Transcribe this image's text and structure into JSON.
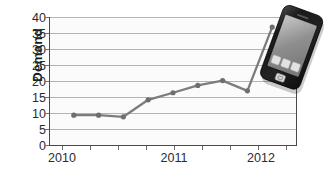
{
  "chart_data": {
    "type": "line",
    "title": "",
    "subtitle": "",
    "xlabel": "",
    "ylabel": "Demand",
    "ylim": [
      0,
      40
    ],
    "ytick_labels": [
      "40",
      "35",
      "30",
      "25",
      "20",
      "15",
      "10",
      "5",
      "0"
    ],
    "ytick_values": [
      40,
      35,
      30,
      25,
      20,
      15,
      10,
      5,
      0
    ],
    "xtick_labels": [
      "2010",
      "2011",
      "2012"
    ],
    "xtick_values": [
      2010,
      2011,
      2012
    ],
    "grid": "horizontal",
    "legend": "none",
    "marker": "circle",
    "x": [
      2010.0,
      2010.25,
      2010.5,
      2010.75,
      2011.0,
      2011.25,
      2011.5,
      2011.75,
      2012.0
    ],
    "values": [
      9.5,
      9.5,
      9.0,
      14.3,
      16.5,
      18.8,
      20.3,
      17.1,
      37.0
    ],
    "series": [
      {
        "name": "Demand",
        "values": [
          9.5,
          9.5,
          9.0,
          14.3,
          16.5,
          18.8,
          20.3,
          17.1,
          37.0
        ]
      }
    ],
    "colors": {
      "line": "#7c7c7c",
      "marker": "#6e6e6e",
      "grid": "#b4b4b4",
      "axis": "#3a3a3a",
      "plot_background": "#fbfbfb",
      "text": "#2b2b2b"
    }
  },
  "overlay": {
    "phone": {
      "icon_name": "smartphone-photo",
      "body_color": "#1c1c1c",
      "screen_color": "#8e8e8e",
      "app_icons": 3,
      "home_button": "home-button"
    }
  }
}
